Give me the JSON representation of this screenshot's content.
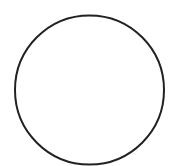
{
  "canvas": {
    "width": 171,
    "height": 166,
    "background": "#ffffff"
  },
  "shapes": [
    {
      "type": "circle",
      "cx": 89.5,
      "cy": 90,
      "r": 74.5,
      "stroke": "#222222",
      "stroke_width": 2,
      "fill": "none"
    }
  ]
}
